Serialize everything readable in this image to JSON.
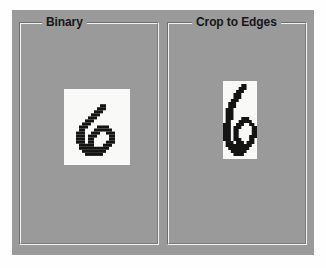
{
  "window": {
    "background_color": "#fefefe",
    "panel_color": "#9a9a9a"
  },
  "panels": [
    {
      "id": "binary",
      "title": "Binary",
      "image": {
        "name": "binary-digit-image",
        "alt": "Pixelated black-and-white binary image of handwritten digit 6 on a white square background",
        "digit": "6",
        "background_color": "#f9f9f7",
        "foreground_color": "#141414",
        "grid_cols": 22,
        "grid_rows": 25,
        "pixels": [
          "0000000000000000000000",
          "0000000000000000000000",
          "0000000000000000000000",
          "0000000000000000000000",
          "0000000000000000000000",
          "0000000000001100000000",
          "0000000000011100000000",
          "0000000000111000000000",
          "0000000001110000000000",
          "0000000011100000000000",
          "0000000111000000000000",
          "0000001110000000000000",
          "0000011100011110000000",
          "0000011000111111000000",
          "0000111001110011100000",
          "0000111011100001100000",
          "0000111011000001100000",
          "0000111011000011100000",
          "0000011111000111000000",
          "0000011111111110000000",
          "0000001111111100000000",
          "0000000111111000000000",
          "0000000000000000000000",
          "0000000000000000000000",
          "0000000000000000000000"
        ]
      }
    },
    {
      "id": "crop_to_edges",
      "title": "Crop to Edges",
      "image": {
        "name": "cropped-digit-image",
        "alt": "Same binary digit 6 cropped tightly to the ink bounding box",
        "digit": "6",
        "background_color": "#f9f9f7",
        "foreground_color": "#141414",
        "grid_cols": 13,
        "grid_rows": 26,
        "pixels": [
          "0000000000000",
          "0000000110000",
          "0000001110000",
          "0000011100000",
          "0000111000000",
          "0000111000000",
          "0001110000000",
          "0011100000000",
          "0011100000000",
          "0111000000000",
          "0111000000000",
          "0111000000000",
          "0111000111000",
          "0110001111100",
          "1110011100110",
          "1110111000011",
          "1110110000011",
          "1110110000011",
          "1110110000111",
          "1110111000110",
          "0111011101110",
          "0111111111100",
          "0011111111000",
          "0001111110000",
          "0000111100000",
          "0000000000000"
        ]
      }
    }
  ]
}
